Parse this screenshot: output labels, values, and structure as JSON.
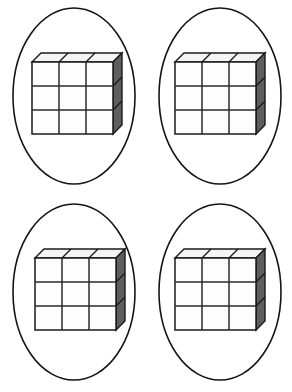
{
  "page": {
    "background_color": "#ffffff",
    "width": 292,
    "height": 392,
    "layout": "2x2 grid of circled cube arrays"
  },
  "style": {
    "ellipse_stroke_color": "#151515",
    "cube_front_fill": "#fdfdfd",
    "cube_top_fill": "#f4f4f4",
    "cube_side_fill": "#5e5e5e",
    "cube_stroke_color": "#1a1a1a"
  },
  "cube_model": {
    "columns": 3,
    "rows": 3,
    "depth": 1,
    "visible_cube_count": 9,
    "total_cube_count": 9,
    "front_face_cells": 9,
    "top_face_segments": 3,
    "right_face_segments": 3,
    "cell_width": 27,
    "cell_height": 24,
    "depth_offset_x": 9,
    "depth_offset_y": 9,
    "projection": "oblique-cabinet"
  },
  "groups": [
    {
      "id": "group-1",
      "position": "top-left",
      "label": "Group 1",
      "cube_count": 9,
      "columns": 3,
      "rows": 3,
      "ellipse": {
        "cx": 74,
        "cy": 96,
        "rx": 61,
        "ry": 88
      },
      "array_origin": {
        "x": 32,
        "y": 62
      }
    },
    {
      "id": "group-2",
      "position": "top-right",
      "label": "Group 2",
      "cube_count": 9,
      "columns": 3,
      "rows": 3,
      "ellipse": {
        "cx": 74,
        "cy": 96,
        "rx": 61,
        "ry": 88
      },
      "array_origin": {
        "x": 29,
        "y": 62
      }
    },
    {
      "id": "group-3",
      "position": "bottom-left",
      "label": "Group 3",
      "cube_count": 9,
      "columns": 3,
      "rows": 3,
      "ellipse": {
        "cx": 74,
        "cy": 96,
        "rx": 61,
        "ry": 88
      },
      "array_origin": {
        "x": 35,
        "y": 62
      }
    },
    {
      "id": "group-4",
      "position": "bottom-right",
      "label": "Group 4",
      "cube_count": 9,
      "columns": 3,
      "rows": 3,
      "ellipse": {
        "cx": 74,
        "cy": 96,
        "rx": 61,
        "ry": 88
      },
      "array_origin": {
        "x": 29,
        "y": 62
      }
    }
  ],
  "totals": {
    "group_count": 4,
    "cubes_per_group": 9,
    "total_cubes": 36
  }
}
